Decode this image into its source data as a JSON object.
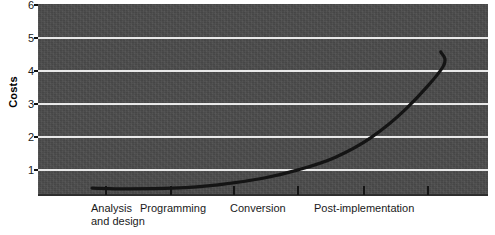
{
  "chart_data": {
    "type": "line",
    "title": "",
    "subtitle": "",
    "xlabel": "",
    "ylabel": "Costs",
    "ylim": [
      0,
      6
    ],
    "yticks": [
      1,
      2,
      3,
      4,
      5,
      6
    ],
    "ytick_labels": [
      "1",
      "2",
      "3",
      "4",
      "5",
      "6"
    ],
    "grid": true,
    "grid_axis": "y",
    "legend": false,
    "legend_position": "none",
    "background_color": "#4b4b4b",
    "gridline_color": "#e9e9e9",
    "line_color": "#141414",
    "line_width": 3,
    "categories": [
      "Analysis and design",
      "Programming",
      "Conversion",
      "Post-implementation"
    ],
    "category_label_lines": [
      [
        "Analysis",
        "and design"
      ],
      [
        "Programming"
      ],
      [
        "Conversion"
      ],
      [
        "Post-implementation"
      ]
    ],
    "x_tick_positions_px": [
      105,
      170,
      233,
      297,
      363,
      427
    ],
    "series": [
      {
        "name": "Costs",
        "x": [
          0.12,
          0.2,
          0.3,
          0.4,
          0.5,
          0.58,
          0.66,
          0.74,
          0.82,
          0.9
        ],
        "values": [
          0.42,
          0.4,
          0.42,
          0.52,
          0.72,
          0.98,
          1.35,
          1.95,
          2.85,
          4.1
        ],
        "end_point": {
          "x": 0.895,
          "y": 4.55
        }
      }
    ],
    "annotations": []
  },
  "axes": {
    "y_title": "Costs",
    "y_tick_labels": [
      "6",
      "5",
      "4",
      "3",
      "2",
      "1"
    ]
  },
  "x_categories": [
    {
      "line1": "Analysis",
      "line2": "and design"
    },
    {
      "line1": "Programming",
      "line2": ""
    },
    {
      "line1": "Conversion",
      "line2": ""
    },
    {
      "line1": "Post-implementation",
      "line2": ""
    }
  ]
}
